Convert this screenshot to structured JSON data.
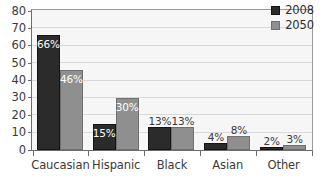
{
  "chart_data": {
    "type": "bar",
    "title": "",
    "subtitle": "",
    "xlabel": "",
    "ylabel": "",
    "ylim": [
      0,
      80
    ],
    "ytick_step": 10,
    "yticks": [
      0,
      10,
      20,
      30,
      40,
      50,
      60,
      70,
      80
    ],
    "grid": true,
    "grid_orientation": "horizontal",
    "legend_position": "top-right",
    "categories": [
      "Caucasian",
      "Hispanic",
      "Black",
      "Asian",
      "Other"
    ],
    "series": [
      {
        "name": "2008",
        "color": "#2b2b2b",
        "values": [
          66,
          15,
          13,
          4,
          2
        ],
        "data_labels": [
          "66%",
          "15%",
          "13%",
          "4%",
          "2%"
        ]
      },
      {
        "name": "2050",
        "color": "#8f8f8f",
        "values": [
          46,
          30,
          13,
          8,
          3
        ],
        "data_labels": [
          "46%",
          "30%",
          "13%",
          "8%",
          "3%"
        ]
      }
    ]
  },
  "legend": {
    "entries": [
      {
        "label": "2008"
      },
      {
        "label": "2050"
      }
    ]
  },
  "colors": {
    "series_2008": "#2b2b2b",
    "series_2050": "#8f8f8f",
    "plot_background": "#f6f6f6",
    "gridline": "#d9d9d9",
    "axis": "#6d6d6d",
    "text": "#3a3a3a"
  }
}
